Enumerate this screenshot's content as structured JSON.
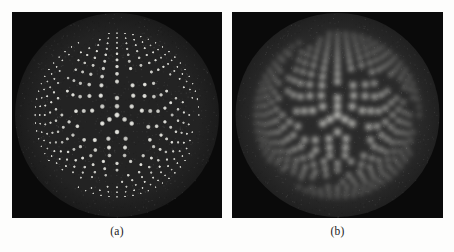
{
  "figure": {
    "background_color": "#fdfdfc",
    "panel_count": 2,
    "panels": [
      {
        "id": "panel-a",
        "caption": "(a)",
        "x": 12,
        "y": 12,
        "width": 210,
        "height": 206,
        "caption_y": 224,
        "condition": "sharp",
        "description": "High resolution reconstruction: individual point sources resolved in all rings",
        "blur_sigma": 0.0,
        "dot_radius_scale": 1.0,
        "brightness": 1.0,
        "background_color": "#0a0a0a",
        "disk_color": "#232323",
        "disk_edge_color": "#1b1b1b",
        "dot_color": "#f0f0ea"
      },
      {
        "id": "panel-b",
        "caption": "(b)",
        "x": 232,
        "y": 12,
        "width": 211,
        "height": 206,
        "caption_y": 224,
        "condition": "blurred",
        "description": "Lower resolution reconstruction: outer dense rings blur into continuous arcs",
        "blur_sigma": 2.6,
        "dot_radius_scale": 1.45,
        "brightness": 1.25,
        "background_color": "#0a0a0a",
        "disk_color": "#2a2a2a",
        "disk_edge_color": "#202020",
        "dot_color": "#fbfbf5"
      }
    ]
  },
  "chart_data": {
    "type": "scatter",
    "title": "",
    "xlabel": "",
    "ylabel": "",
    "subtitle": "Dual-panel circular resolution phantom: concentric rings of point sources",
    "grid": false,
    "legend": false,
    "legend_position": "none",
    "xlim": [
      -1.0,
      1.0
    ],
    "ylim": [
      -1.0,
      1.0
    ],
    "phantom": {
      "disk_radius": 0.9,
      "center": [
        0.0,
        0.0
      ],
      "sector_gap_deg": 16,
      "spiral_gap_offset_deg": 48,
      "ring_groups": [
        {
          "name": "center-cluster",
          "radius": 0.0,
          "count": 1,
          "dot_radius": 0.03,
          "intensity": 1.0
        },
        {
          "name": "ring-1",
          "radius": 0.085,
          "count": 3,
          "dot_radius": 0.028,
          "intensity": 0.96
        },
        {
          "name": "ring-2",
          "radius": 0.165,
          "count": 6,
          "dot_radius": 0.027,
          "intensity": 0.95
        },
        {
          "name": "ring-3",
          "radius": 0.245,
          "count": 9,
          "dot_radius": 0.026,
          "intensity": 0.94
        },
        {
          "name": "ring-4",
          "radius": 0.325,
          "count": 13,
          "dot_radius": 0.025,
          "intensity": 0.93
        },
        {
          "name": "ring-5",
          "radius": 0.4,
          "count": 17,
          "dot_radius": 0.023,
          "intensity": 0.92
        },
        {
          "name": "ring-6",
          "radius": 0.47,
          "count": 22,
          "dot_radius": 0.021,
          "intensity": 0.91
        },
        {
          "name": "ring-7",
          "radius": 0.535,
          "count": 28,
          "dot_radius": 0.019,
          "intensity": 0.9
        },
        {
          "name": "ring-8",
          "radius": 0.595,
          "count": 34,
          "dot_radius": 0.017,
          "intensity": 0.89
        },
        {
          "name": "ring-9",
          "radius": 0.65,
          "count": 41,
          "dot_radius": 0.015,
          "intensity": 0.88
        },
        {
          "name": "ring-10",
          "radius": 0.702,
          "count": 48,
          "dot_radius": 0.0135,
          "intensity": 0.87
        },
        {
          "name": "ring-11",
          "radius": 0.75,
          "count": 56,
          "dot_radius": 0.012,
          "intensity": 0.86
        },
        {
          "name": "ring-12",
          "radius": 0.795,
          "count": 64,
          "dot_radius": 0.0108,
          "intensity": 0.85
        }
      ],
      "notes": [
        "Dot spacing decreases monotonically with radius, forming a resolution test target",
        "Each ring group is broken by angular gaps that rotate with radius, producing a pinwheel/spiral appearance",
        "Panel (a) resolves every dot; panel (b) smears outer rings into solid arcs"
      ]
    }
  }
}
